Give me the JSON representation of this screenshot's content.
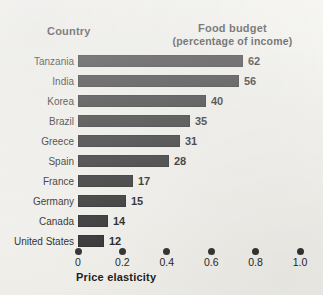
{
  "headers": {
    "country": "Country",
    "food_budget_line1": "Food budget",
    "food_budget_line2": "(percentage of income)"
  },
  "axis": {
    "x_title": "Price elasticity",
    "tick_labels": [
      "0",
      "0.2",
      "0.4",
      "0.6",
      "0.8",
      "1.0"
    ],
    "tick_values": [
      0,
      0.2,
      0.4,
      0.6,
      0.8,
      1.0
    ]
  },
  "colors": {
    "bar": "#262626",
    "background": "#f2f1ec",
    "text": "#111111"
  },
  "chart_data": {
    "type": "bar",
    "orientation": "horizontal",
    "xlabel": "Price elasticity",
    "ylabel": "Country",
    "value_axis_label": "Food budget (percentage of income)",
    "xlim": [
      0,
      1.0
    ],
    "grid": false,
    "legend": false,
    "categories": [
      "Tanzania",
      "India",
      "Korea",
      "Brazil",
      "Greece",
      "Spain",
      "France",
      "Germany",
      "Canada",
      "United States"
    ],
    "values": [
      62,
      56,
      40,
      35,
      31,
      28,
      17,
      15,
      14,
      12
    ],
    "value_labels": [
      "62",
      "56",
      "40",
      "35",
      "31",
      "28",
      "17",
      "15",
      "14",
      "12"
    ],
    "price_elasticity": [
      0.75,
      0.73,
      0.58,
      0.51,
      0.46,
      0.41,
      0.25,
      0.22,
      0.21,
      0.17
    ],
    "series": [
      {
        "name": "Food budget (percentage of income)",
        "values": [
          62,
          56,
          40,
          35,
          31,
          28,
          17,
          15,
          14,
          12
        ]
      }
    ]
  },
  "rows": [
    {
      "country": "Tanzania",
      "value": 62,
      "label": "62",
      "bar_px": 165
    },
    {
      "country": "India",
      "value": 56,
      "label": "56",
      "bar_px": 161
    },
    {
      "country": "Korea",
      "value": 40,
      "label": "40",
      "bar_px": 128
    },
    {
      "country": "Brazil",
      "value": 35,
      "label": "35",
      "bar_px": 112
    },
    {
      "country": "Greece",
      "value": 31,
      "label": "31",
      "bar_px": 102
    },
    {
      "country": "Spain",
      "value": 28,
      "label": "28",
      "bar_px": 91
    },
    {
      "country": "France",
      "value": 17,
      "label": "17",
      "bar_px": 55
    },
    {
      "country": "Germany",
      "value": 15,
      "label": "15",
      "bar_px": 48
    },
    {
      "country": "Canada",
      "value": 14,
      "label": "14",
      "bar_px": 30
    },
    {
      "country": "United States",
      "value": 12,
      "label": "12",
      "bar_px": 26
    }
  ]
}
